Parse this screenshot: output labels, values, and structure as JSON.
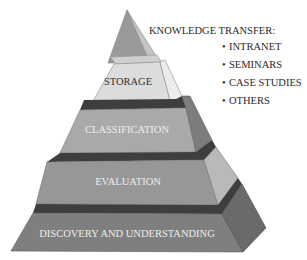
{
  "diagram": {
    "type": "pyramid",
    "levels": [
      {
        "label": "STORAGE",
        "position": 2
      },
      {
        "label": "CLASSIFICATION",
        "position": 3
      },
      {
        "label": "EVALUATION",
        "position": 4
      },
      {
        "label": "DISCOVERY AND UNDERSTANDING",
        "position": 5
      }
    ],
    "apex": {
      "label": ""
    },
    "annotation": {
      "title": "KNOWLEDGE TRANSFER:",
      "bullet": "•",
      "items": [
        "INTRANET",
        "SEMINARS",
        "CASE STUDIES",
        "OTHERS"
      ]
    },
    "colors": {
      "apex_front": "#9a9a9a",
      "apex_side": "#c4c4c4",
      "storage_front": "#dcdcdc",
      "storage_side": "#ececec",
      "storage_top": "#cfcfcf",
      "classification_front": "#a9a9a9",
      "classification_side": "#7d7d7d",
      "evaluation_front": "#979797",
      "evaluation_side": "#b9b9b9",
      "discovery_front": "#7f7f7f",
      "discovery_side": "#6a6a6a",
      "band": "#3e3e3e",
      "text_dark": "#333333",
      "text_light": "#eeeeee"
    }
  }
}
